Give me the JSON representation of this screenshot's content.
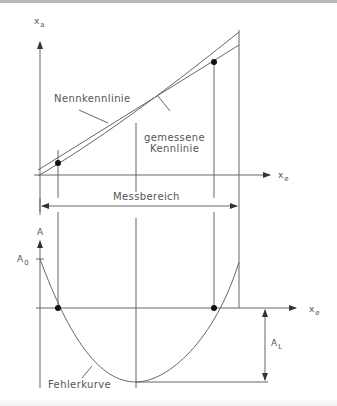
{
  "upper_chart": {
    "y_axis_label": "x",
    "y_axis_sub": "a",
    "x_axis_label": "x",
    "x_axis_sub": "e",
    "curve_labels": {
      "nominal": "Nennkennlinie",
      "measured_line1": "gemessene",
      "measured_line2": "Kennlinie"
    },
    "range_label": "Messbereich"
  },
  "lower_chart": {
    "y_axis_label": "A",
    "a0_label": "A",
    "a0_sub": "0",
    "x_axis_label": "x",
    "x_axis_sub": "e",
    "al_label": "A",
    "al_sub": "L",
    "curve_label": "Fehlerkurve"
  },
  "colors": {
    "line": "#555555",
    "dot": "#111111",
    "text": "#555555"
  }
}
